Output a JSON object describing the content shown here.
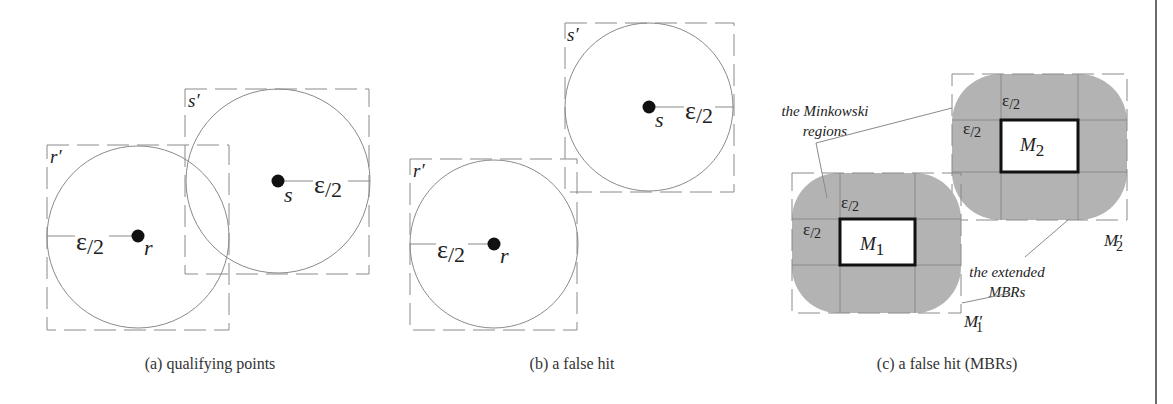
{
  "colors": {
    "line": "#8a8a8a",
    "dash": "#8a8a8a",
    "point": "#111111",
    "minkowski_fill": "#b3b3b3",
    "mbr_stroke": "#111111",
    "rule": "#6b6b6b"
  },
  "panel_a": {
    "caption": "(a) qualifying points",
    "r_label": "r",
    "r_box_label": "r′",
    "s_label": "s",
    "s_box_label": "s′",
    "r_radius_label_eps": "ε",
    "r_radius_label_den": "/2",
    "s_radius_label_eps": "ε",
    "s_radius_label_den": "/2"
  },
  "panel_b": {
    "caption": "(b) a false hit",
    "r_label": "r",
    "r_box_label": "r′",
    "s_label": "s",
    "s_box_label": "s′",
    "r_radius_label_eps": "ε",
    "r_radius_label_den": "/2",
    "s_radius_label_eps": "ε",
    "s_radius_label_den": "/2"
  },
  "panel_c": {
    "caption": "(c) a false hit (MBRs)",
    "m1_label": "M",
    "m1_sub": "1",
    "m2_label": "M",
    "m2_sub": "2",
    "m1_ext_label": "M′",
    "m1_ext_sub": "1",
    "m2_ext_label": "M′",
    "m2_ext_sub": "2",
    "eps_label": "ε",
    "eps_den": "/2",
    "annotation_minkowski_line1": "the Minkowski",
    "annotation_minkowski_line2": "regions",
    "annotation_extended_line1": "the extended",
    "annotation_extended_line2": "MBRs"
  }
}
